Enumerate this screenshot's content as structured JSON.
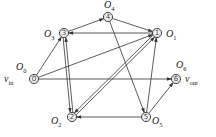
{
  "diagram": {
    "type": "directed-graph",
    "colors": {
      "stroke": "#333333",
      "background": "#ffffff"
    },
    "nodes": [
      {
        "id": "0",
        "num": "0",
        "x": 34,
        "y": 79,
        "label": "O",
        "sub": "0",
        "io_label": "v",
        "io_sub": "in"
      },
      {
        "id": "1",
        "num": "1",
        "x": 157,
        "y": 33,
        "label": "O",
        "sub": "1"
      },
      {
        "id": "2",
        "num": "2",
        "x": 72,
        "y": 117,
        "label": "O",
        "sub": "2"
      },
      {
        "id": "3",
        "num": "3",
        "x": 64,
        "y": 33,
        "label": "O",
        "sub": "3"
      },
      {
        "id": "4",
        "num": "4",
        "x": 108,
        "y": 17,
        "label": "O",
        "sub": "4"
      },
      {
        "id": "5",
        "num": "5",
        "x": 146,
        "y": 117,
        "label": "O",
        "sub": "5"
      },
      {
        "id": "6",
        "num": "6",
        "x": 176,
        "y": 79,
        "label": "O",
        "sub": "6",
        "io_label": "v",
        "io_sub": "out"
      }
    ],
    "edges": [
      {
        "from": "0",
        "to": "3"
      },
      {
        "from": "0",
        "to": "1"
      },
      {
        "from": "0",
        "to": "6"
      },
      {
        "from": "3",
        "to": "4"
      },
      {
        "from": "4",
        "to": "1"
      },
      {
        "from": "1",
        "to": "3"
      },
      {
        "from": "4",
        "to": "5"
      },
      {
        "from": "3",
        "to": "2"
      },
      {
        "from": "2",
        "to": "3"
      },
      {
        "from": "1",
        "to": "2"
      },
      {
        "from": "2",
        "to": "1"
      },
      {
        "from": "5",
        "to": "2"
      },
      {
        "from": "5",
        "to": "1"
      },
      {
        "from": "5",
        "to": "6"
      }
    ]
  }
}
